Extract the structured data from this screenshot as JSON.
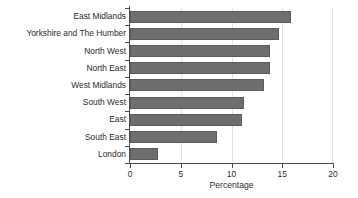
{
  "chart_data": {
    "type": "bar",
    "orientation": "horizontal",
    "title": "",
    "xlabel": "Percentage",
    "ylabel": "",
    "xlim": [
      0,
      20
    ],
    "xticks": [
      0,
      5,
      10,
      15,
      20
    ],
    "xtick_labels": [
      "0",
      "5",
      "10",
      "15",
      "20"
    ],
    "grid": "vertical",
    "legend": "none",
    "bar_color": "#6e6e6e",
    "bar_edge_color": "#5a5a5a",
    "axis_color": "#4a4a4a",
    "gridline_color": "#e3e3e3",
    "background_color": "#ffffff",
    "categories": [
      "East Midlands",
      "Yorkshire and The Humber",
      "North West",
      "North East",
      "West Midlands",
      "South West",
      "East",
      "South East",
      "London"
    ],
    "values": [
      15.9,
      14.7,
      13.8,
      13.8,
      13.2,
      11.2,
      11.0,
      8.6,
      2.8
    ]
  }
}
